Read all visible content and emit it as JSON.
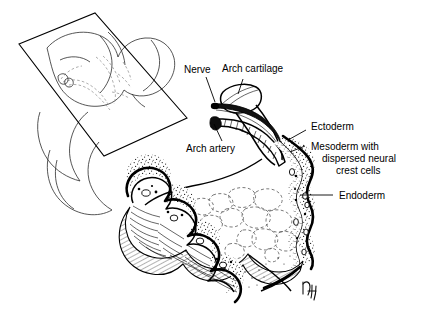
{
  "figure": {
    "background_color": "#ffffff",
    "ink_color": "#000000",
    "width": 435,
    "height": 322
  },
  "labels": {
    "nerve": "Nerve",
    "arch_cartilage": "Arch cartilage",
    "arch_artery": "Arch artery",
    "ectoderm": "Ectoderm",
    "mesoderm_line1": "Mesoderm with",
    "mesoderm_line2": "dispersed neural",
    "mesoderm_line3": "crest cells",
    "endoderm": "Endoderm"
  },
  "signature": {
    "monogram": "artist-monogram"
  },
  "structures": {
    "embryo_inset": "embryo-head-with-section-plane",
    "section_plane": "cutting-plane-parallelogram",
    "cartilage_fill": "hatched",
    "mesoderm_fill": "stippled",
    "cut_surface_fill": "line-hatched",
    "pharynx_cells": "dashed-polygons"
  }
}
